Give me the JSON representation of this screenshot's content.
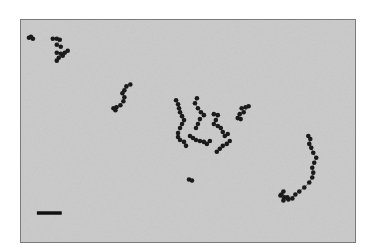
{
  "figure": {
    "type": "electron-micrograph",
    "background_color": "#cdcdcd",
    "particle_color": "#1a1a1a",
    "border_color": "#7a7a7a",
    "scale_bar": {
      "label": "",
      "color": "#111111"
    },
    "chains": [
      {
        "name": "chain-top-left-a",
        "particles": [
          [
            28,
            37
          ],
          [
            30,
            36
          ],
          [
            32,
            38
          ]
        ]
      },
      {
        "name": "chain-top-left-b",
        "particles": [
          [
            52,
            38
          ],
          [
            56,
            38
          ],
          [
            59,
            39
          ],
          [
            56,
            44
          ],
          [
            60,
            46
          ]
        ]
      },
      {
        "name": "chain-top-left-c",
        "particles": [
          [
            56,
            52
          ],
          [
            60,
            53
          ],
          [
            64,
            52
          ],
          [
            67,
            50
          ],
          [
            62,
            55
          ],
          [
            58,
            57
          ],
          [
            56,
            60
          ]
        ]
      },
      {
        "name": "chain-upper-left",
        "particles": [
          [
            130,
            84
          ],
          [
            126,
            86
          ],
          [
            124,
            90
          ],
          [
            122,
            93
          ],
          [
            124,
            97
          ],
          [
            123,
            101
          ],
          [
            120,
            105
          ],
          [
            116,
            107
          ],
          [
            113,
            108
          ],
          [
            115,
            110
          ]
        ]
      },
      {
        "name": "chain-center-a",
        "particles": [
          [
            176,
            100
          ],
          [
            178,
            104
          ],
          [
            179,
            108
          ],
          [
            180,
            112
          ],
          [
            182,
            116
          ],
          [
            184,
            120
          ],
          [
            182,
            124
          ],
          [
            180,
            128
          ],
          [
            178,
            133
          ],
          [
            178,
            137
          ],
          [
            180,
            140
          ],
          [
            184,
            142
          ],
          [
            186,
            146
          ]
        ]
      },
      {
        "name": "chain-center-b",
        "particles": [
          [
            197,
            98
          ],
          [
            195,
            103
          ],
          [
            198,
            108
          ],
          [
            201,
            112
          ],
          [
            204,
            115
          ],
          [
            200,
            119
          ],
          [
            198,
            124
          ],
          [
            196,
            128
          ]
        ]
      },
      {
        "name": "chain-center-c",
        "particles": [
          [
            190,
            136
          ],
          [
            193,
            138
          ],
          [
            196,
            140
          ],
          [
            200,
            141
          ],
          [
            204,
            142
          ],
          [
            207,
            144
          ],
          [
            210,
            141
          ]
        ]
      },
      {
        "name": "chain-center-d",
        "particles": [
          [
            214,
            114
          ],
          [
            218,
            115
          ],
          [
            216,
            120
          ],
          [
            214,
            124
          ],
          [
            218,
            126
          ],
          [
            221,
            128
          ],
          [
            223,
            132
          ],
          [
            225,
            136
          ],
          [
            228,
            134
          ]
        ]
      },
      {
        "name": "chain-center-e",
        "particles": [
          [
            230,
            141
          ],
          [
            227,
            144
          ],
          [
            223,
            146
          ],
          [
            220,
            149
          ],
          [
            217,
            152
          ]
        ]
      },
      {
        "name": "chain-right-small",
        "particles": [
          [
            242,
            108
          ],
          [
            246,
            107
          ],
          [
            249,
            106
          ],
          [
            244,
            112
          ],
          [
            240,
            114
          ],
          [
            238,
            118
          ],
          [
            241,
            119
          ]
        ]
      },
      {
        "name": "chain-single",
        "particles": [
          [
            189,
            180
          ],
          [
            192,
            181
          ]
        ]
      },
      {
        "name": "chain-right-long",
        "particles": [
          [
            309,
            136
          ],
          [
            311,
            139
          ],
          [
            310,
            144
          ],
          [
            312,
            148
          ],
          [
            314,
            153
          ],
          [
            317,
            158
          ],
          [
            315,
            163
          ],
          [
            313,
            168
          ],
          [
            314,
            173
          ],
          [
            313,
            178
          ],
          [
            310,
            183
          ],
          [
            305,
            188
          ],
          [
            300,
            192
          ],
          [
            296,
            195
          ],
          [
            293,
            199
          ],
          [
            289,
            200
          ],
          [
            285,
            198
          ],
          [
            282,
            195
          ],
          [
            284,
            192
          ],
          [
            281,
            196
          ],
          [
            284,
            201
          ],
          [
            288,
            198
          ]
        ]
      }
    ],
    "scale_bar_length_fraction": 0.075
  }
}
